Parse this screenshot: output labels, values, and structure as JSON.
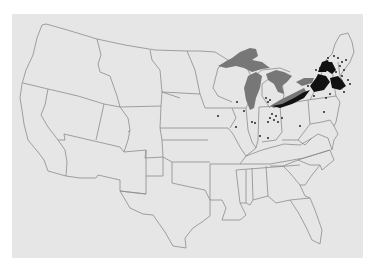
{
  "map": {
    "type": "choropleth-dot-map",
    "region": "Contiguous United States",
    "background_color": "#ffffff",
    "panel_color": "#e6e6e6",
    "border_color": "#8c8c8c",
    "lake_color": "#777777",
    "density_color": "#111111",
    "features": {
      "great_lakes": [
        "Superior",
        "Michigan",
        "Huron",
        "Erie",
        "Ontario"
      ],
      "dense_regions": [
        "Lake Erie shore (Ohio/Pennsylvania)",
        "Upstate New York",
        "Southern New England"
      ],
      "scattered_points_states": [
        "Illinois",
        "Indiana",
        "Ohio",
        "Iowa",
        "Kentucky",
        "Vermont",
        "New Hampshire",
        "Maine"
      ]
    }
  }
}
